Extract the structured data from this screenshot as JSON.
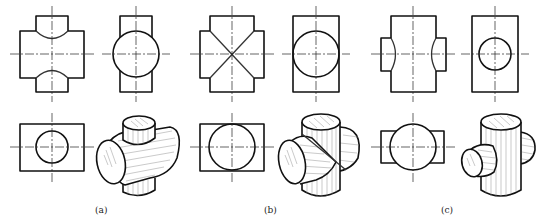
{
  "figure": {
    "panels": [
      {
        "id": "a",
        "label": "(a)",
        "description": "Two perpendicular cylinders, horizontal cylinder larger diameter than vertical cylinder",
        "views": [
          "front-view",
          "side-view",
          "top-view",
          "isometric"
        ]
      },
      {
        "id": "b",
        "label": "(b)",
        "description": "Two perpendicular cylinders of equal diameter, intersection lines appear as straight X",
        "views": [
          "front-view",
          "side-view",
          "top-view",
          "isometric"
        ]
      },
      {
        "id": "c",
        "label": "(c)",
        "description": "Two perpendicular cylinders, vertical cylinder larger diameter than horizontal cylinder",
        "views": [
          "front-view",
          "side-view",
          "top-view",
          "isometric"
        ]
      }
    ]
  }
}
